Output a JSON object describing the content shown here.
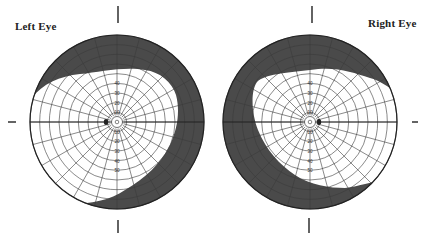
{
  "left_eye": {
    "label": "Left Eye",
    "center": [
      117,
      122
    ],
    "radius": 87,
    "blind_spot_side": "left",
    "scale_labels_up": [
      "10",
      "20",
      "30",
      "40"
    ],
    "scale_labels_down": [
      "10",
      "20",
      "30",
      "40",
      "50"
    ],
    "field_defect": "superior and temporal (right-side) peripheral loss"
  },
  "right_eye": {
    "label": "Right Eye",
    "center": [
      310,
      122
    ],
    "radius": 87,
    "blind_spot_side": "right",
    "scale_labels_up": [
      "10",
      "20",
      "30",
      "40"
    ],
    "scale_labels_down": [
      "10",
      "20",
      "30",
      "40",
      "50"
    ],
    "field_defect": "superior and temporal (left-side) peripheral loss"
  },
  "colors": {
    "defect": "#4a4a4a",
    "grid": "#3a3a3a",
    "background": "#ffffff"
  },
  "ring_count": 9,
  "meridian_count": 24
}
